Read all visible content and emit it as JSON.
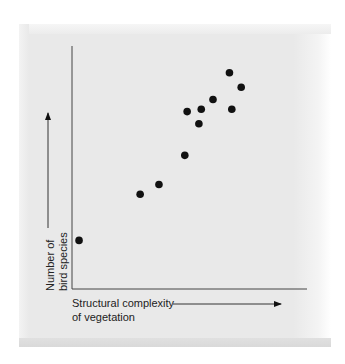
{
  "chart_data": {
    "type": "scatter",
    "title": "",
    "xlabel": "Structural complexity of vegetation",
    "ylabel": "Number of bird species",
    "xlabel_lines": [
      "Structural complexity",
      "of vegetation"
    ],
    "ylabel_lines": [
      "Number of",
      "bird species"
    ],
    "axes": {
      "ticks": false,
      "tick_labels": false,
      "grid": false
    },
    "xlim": [
      0,
      100
    ],
    "ylim": [
      0,
      100
    ],
    "points": [
      {
        "x": 3,
        "y": 20
      },
      {
        "x": 29,
        "y": 39
      },
      {
        "x": 37,
        "y": 43
      },
      {
        "x": 48,
        "y": 55
      },
      {
        "x": 49,
        "y": 73
      },
      {
        "x": 54,
        "y": 68
      },
      {
        "x": 55,
        "y": 74
      },
      {
        "x": 60,
        "y": 78
      },
      {
        "x": 67,
        "y": 89
      },
      {
        "x": 68,
        "y": 74
      },
      {
        "x": 72,
        "y": 83
      }
    ],
    "point_color": "#111111",
    "legend": null
  },
  "labels": {
    "x_line1": "Structural complexity",
    "x_line2": "of vegetation",
    "y_line1": "Number of",
    "y_line2": "bird species"
  }
}
